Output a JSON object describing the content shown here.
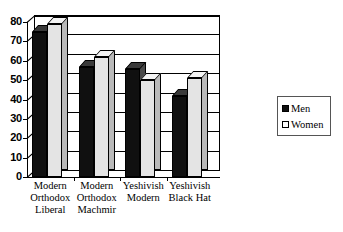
{
  "chart_data": {
    "type": "bar",
    "title": "",
    "subtitle": "",
    "xlabel": "",
    "ylabel": "",
    "ylim": [
      0,
      80
    ],
    "yticks": [
      80,
      70,
      60,
      50,
      40,
      30,
      20,
      10,
      0
    ],
    "grid": true,
    "legend_position": "right",
    "categories": [
      "Modern Orthodox Liberal",
      "Modern Orthodox Machmir",
      "Yeshivish Modern",
      "Yeshivish Black Hat"
    ],
    "category_lines": [
      [
        "Modern",
        "Orthodox",
        "Liberal"
      ],
      [
        "Modern",
        "Orthodox",
        "Machmir"
      ],
      [
        "Yeshivish",
        "Modern"
      ],
      [
        "Yeshivish",
        "Black Hat"
      ]
    ],
    "series": [
      {
        "name": "Men",
        "color": "#101010",
        "values": [
          75,
          57,
          56,
          42
        ]
      },
      {
        "name": "Women",
        "color": "#e4e4e4",
        "values": [
          79,
          62,
          50,
          51
        ]
      }
    ]
  },
  "legend": {
    "items": [
      {
        "label": "Men"
      },
      {
        "label": "Women"
      }
    ]
  },
  "colors": {
    "men": "#101010",
    "women": "#e4e4e4",
    "axis": "#000000",
    "background": "#ffffff"
  }
}
